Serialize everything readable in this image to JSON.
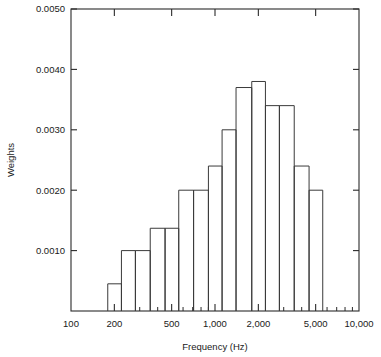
{
  "chart_data": {
    "type": "bar",
    "title": "",
    "xlabel": "Frequency (Hz)",
    "ylabel": "Weights",
    "xscale": "log",
    "yscale": "linear",
    "xlim": [
      100,
      10000
    ],
    "ylim": [
      0.0,
      0.005
    ],
    "grid": false,
    "legend": null,
    "x_tick_labels": [
      "100",
      "200",
      "500",
      "1,000",
      "2,000",
      "5,000",
      "10,000"
    ],
    "x_tick_values": [
      100,
      200,
      500,
      1000,
      2000,
      5000,
      10000
    ],
    "y_tick_labels": [
      "0.0010",
      "0.0020",
      "0.0030",
      "0.0040",
      "0.0050"
    ],
    "y_tick_values": [
      0.001,
      0.002,
      0.003,
      0.004,
      0.005
    ],
    "bin_edges": [
      180,
      224,
      280,
      355,
      450,
      560,
      710,
      900,
      1120,
      1400,
      1800,
      2240,
      2800,
      3550,
      4500,
      5600
    ],
    "categories": [
      "200",
      "250",
      "315",
      "400",
      "500",
      "630",
      "800",
      "1,000",
      "1,250",
      "1,600",
      "2,000",
      "2,500",
      "3,150",
      "4,000",
      "5,000"
    ],
    "values": [
      0.00045,
      0.001,
      0.001,
      0.00137,
      0.00137,
      0.002,
      0.002,
      0.0024,
      0.003,
      0.0037,
      0.0038,
      0.0034,
      0.0034,
      0.0024,
      0.002
    ],
    "series": [
      {
        "name": "Weights",
        "values": [
          0.00045,
          0.001,
          0.001,
          0.00137,
          0.00137,
          0.002,
          0.002,
          0.0024,
          0.003,
          0.0037,
          0.0038,
          0.0034,
          0.0034,
          0.0024,
          0.002
        ]
      }
    ],
    "bar_style": "outline",
    "bar_fill": "none",
    "bar_stroke": "#3a3a3a",
    "background": "#ffffff"
  }
}
